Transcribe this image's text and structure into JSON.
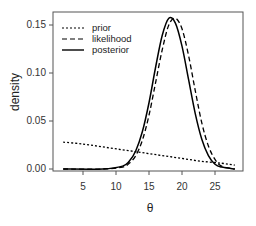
{
  "chart_data": {
    "type": "line",
    "title": "",
    "xlabel": "θ",
    "ylabel": "density",
    "xlim": [
      1.5,
      28.5
    ],
    "ylim": [
      0,
      0.16
    ],
    "x_ticks": [
      5,
      10,
      15,
      20,
      25
    ],
    "y_ticks": [
      "0.00",
      "0.05",
      "0.10",
      "0.15"
    ],
    "grid": false,
    "legend_position": "top-left",
    "series": [
      {
        "name": "prior",
        "line_style": "dotted",
        "x": [
          2,
          5,
          8,
          11,
          14,
          17,
          20,
          23,
          26,
          28
        ],
        "values": [
          0.028,
          0.026,
          0.023,
          0.02,
          0.017,
          0.014,
          0.011,
          0.008,
          0.006,
          0.004
        ]
      },
      {
        "name": "likelihood",
        "line_style": "dashed",
        "x": [
          2,
          8,
          11,
          12,
          13,
          14,
          15,
          16,
          17,
          18,
          19,
          20,
          21,
          22,
          23,
          24,
          25,
          26,
          28
        ],
        "values": [
          0,
          0,
          0.002,
          0.006,
          0.014,
          0.03,
          0.056,
          0.09,
          0.124,
          0.15,
          0.157,
          0.146,
          0.118,
          0.082,
          0.048,
          0.024,
          0.01,
          0.003,
          0
        ]
      },
      {
        "name": "posterior",
        "line_style": "solid",
        "x": [
          2,
          8,
          11,
          12,
          13,
          14,
          15,
          16,
          17,
          18,
          19,
          20,
          21,
          22,
          23,
          24,
          25,
          26,
          28
        ],
        "values": [
          0,
          0,
          0.003,
          0.008,
          0.019,
          0.039,
          0.069,
          0.106,
          0.139,
          0.157,
          0.152,
          0.128,
          0.093,
          0.058,
          0.031,
          0.014,
          0.005,
          0.002,
          0
        ]
      }
    ]
  },
  "legend": {
    "items": [
      {
        "label": "prior",
        "style": "dotted"
      },
      {
        "label": "likelihood",
        "style": "dashed"
      },
      {
        "label": "posterior",
        "style": "solid"
      }
    ]
  },
  "axes": {
    "xlabel": "θ",
    "ylabel": "density",
    "x_tick_labels": [
      "5",
      "10",
      "15",
      "20",
      "25"
    ],
    "y_tick_labels": [
      "0.00",
      "0.05",
      "0.10",
      "0.15"
    ]
  },
  "colors": {
    "line": "#000000",
    "frame": "#555555",
    "background": "#ffffff"
  }
}
